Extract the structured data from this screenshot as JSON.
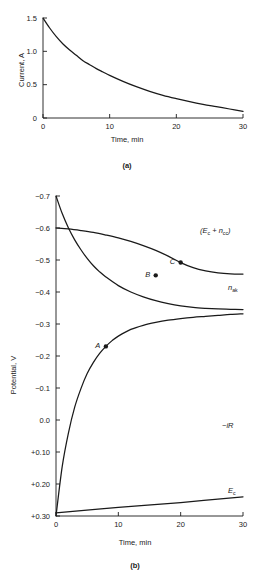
{
  "figure": {
    "background_color": "#ffffff",
    "ink_color": "#1a1a1a"
  },
  "panel_a": {
    "caption": "(a)",
    "xlabel": "Time, min",
    "ylabel": "Current, A"
  },
  "panel_b": {
    "caption": "(b)",
    "xlabel": "Time, min",
    "ylabel": "Potential, V"
  },
  "labels": {
    "ec_plus_ncc_open": "(",
    "ec_plus_ncc_E": "E",
    "ec_plus_ncc_E_sub": "c",
    "ec_plus_ncc_plus": " + ",
    "ec_plus_ncc_n": "n",
    "ec_plus_ncc_n_sub": "cc",
    "ec_plus_ncc_close": ")",
    "n_ak": "n",
    "n_ak_sub": "ak",
    "minus_iR": "−iR",
    "Ec": "E",
    "Ec_sub": "c",
    "point_A": "A",
    "point_B": "B",
    "point_C": "C"
  },
  "chart_data": [
    {
      "type": "line",
      "panel": "a",
      "title": "(a)",
      "xlabel": "Time, min",
      "ylabel": "Current, A",
      "xlim": [
        0,
        30
      ],
      "ylim": [
        0,
        1.5
      ],
      "xticks": [
        0,
        10,
        20,
        30
      ],
      "xtick_labels": [
        "0",
        "10",
        "20",
        "30"
      ],
      "yticks": [
        0,
        0.5,
        1.0,
        1.5
      ],
      "ytick_labels": [
        "0",
        "0.5",
        "1.0",
        "1.5"
      ],
      "y_inverted": false,
      "grid": false,
      "legend": "none",
      "series": [
        {
          "name": "current",
          "label": "",
          "x": [
            0,
            1,
            2,
            3,
            4,
            5,
            6,
            7,
            8,
            9,
            10,
            12,
            14,
            16,
            18,
            20,
            22,
            24,
            26,
            28,
            30
          ],
          "y": [
            1.5,
            1.35,
            1.22,
            1.11,
            1.02,
            0.94,
            0.86,
            0.8,
            0.74,
            0.69,
            0.64,
            0.55,
            0.47,
            0.4,
            0.34,
            0.29,
            0.245,
            0.205,
            0.17,
            0.135,
            0.1
          ]
        }
      ]
    },
    {
      "type": "line",
      "panel": "b",
      "title": "(b)",
      "xlabel": "Time, min",
      "ylabel": "Potential, V",
      "xlim": [
        0,
        30
      ],
      "ylim": [
        -0.7,
        0.3
      ],
      "xticks": [
        0,
        10,
        20,
        30
      ],
      "xtick_labels": [
        "0",
        "10",
        "20",
        "30"
      ],
      "yticks": [
        -0.7,
        -0.6,
        -0.5,
        -0.4,
        -0.3,
        -0.2,
        -0.1,
        0.0,
        0.1,
        0.2,
        0.3
      ],
      "ytick_labels": [
        "−0.7",
        "−0.6",
        "−0.5",
        "−0.4",
        "−0.3",
        "−0.2",
        "−0.1",
        "0.0",
        "+0.10",
        "+0.20",
        "+0.30"
      ],
      "y_inverted": true,
      "grid": false,
      "legend": "inline-curve-labels",
      "series": [
        {
          "name": "ec_plus_ncc",
          "label": "(E_c + n_cc)",
          "x": [
            0,
            2,
            4,
            6,
            8,
            10,
            12,
            14,
            16,
            18,
            20,
            22,
            24,
            26,
            28,
            30
          ],
          "y": [
            -0.6,
            -0.597,
            -0.592,
            -0.586,
            -0.578,
            -0.569,
            -0.558,
            -0.545,
            -0.53,
            -0.512,
            -0.492,
            -0.476,
            -0.466,
            -0.46,
            -0.457,
            -0.456
          ]
        },
        {
          "name": "n_ak",
          "label": "n_ak",
          "x": [
            0,
            1,
            2,
            3,
            4,
            5,
            6,
            7,
            8,
            10,
            12,
            14,
            16,
            18,
            20,
            22,
            24,
            26,
            28,
            30
          ],
          "y": [
            -0.7,
            -0.645,
            -0.6,
            -0.563,
            -0.532,
            -0.505,
            -0.482,
            -0.463,
            -0.447,
            -0.42,
            -0.4,
            -0.385,
            -0.373,
            -0.364,
            -0.357,
            -0.352,
            -0.349,
            -0.347,
            -0.346,
            -0.345
          ]
        },
        {
          "name": "minus_iR",
          "label": "−iR",
          "x": [
            0,
            1,
            2,
            3,
            4,
            5,
            6,
            7,
            8,
            9,
            10,
            12,
            14,
            16,
            18,
            20,
            22,
            24,
            26,
            28,
            30
          ],
          "y": [
            0.3,
            0.145,
            0.04,
            -0.04,
            -0.098,
            -0.145,
            -0.18,
            -0.208,
            -0.23,
            -0.248,
            -0.262,
            -0.283,
            -0.296,
            -0.305,
            -0.312,
            -0.317,
            -0.321,
            -0.324,
            -0.327,
            -0.33,
            -0.332
          ]
        },
        {
          "name": "Ec",
          "label": "E_c",
          "x": [
            0,
            10,
            20,
            30
          ],
          "y": [
            0.29,
            0.273,
            0.258,
            0.24
          ]
        }
      ],
      "annotations": [
        {
          "label": "A",
          "x": 8,
          "y": -0.23,
          "on_series": "minus_iR"
        },
        {
          "label": "B",
          "x": 16,
          "y": -0.452,
          "on_series": "n_ak"
        },
        {
          "label": "C",
          "x": 20,
          "y": -0.492,
          "on_series": "ec_plus_ncc"
        }
      ]
    }
  ]
}
